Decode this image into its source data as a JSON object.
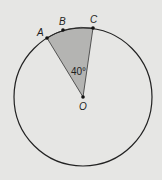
{
  "diagram": {
    "type": "circle-sector",
    "center": {
      "label": "O",
      "x": 83,
      "y": 97
    },
    "radius": 69,
    "points": [
      {
        "label": "A",
        "x": 47,
        "y": 38
      },
      {
        "label": "B",
        "x": 63,
        "y": 30
      },
      {
        "label": "C",
        "x": 93,
        "y": 28
      }
    ],
    "sector": {
      "from": "A",
      "to": "C",
      "angle_label": "40°",
      "fill": "#b4b4b2"
    },
    "colors": {
      "background": "#e6e6e4",
      "stroke": "#222222",
      "sector_fill": "#b4b4b2"
    }
  }
}
